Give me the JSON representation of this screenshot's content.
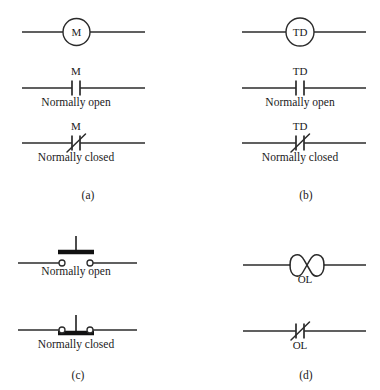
{
  "figure": {
    "background_color": "#ffffff",
    "line_color": "#2b2b2b"
  },
  "panels": [
    {
      "id": "a",
      "caption": "(a)",
      "device": "M",
      "rows": [
        {
          "kind": "coil",
          "label": "M",
          "state_label": ""
        },
        {
          "kind": "contact-no",
          "label": "M",
          "state_label": "Normally open"
        },
        {
          "kind": "contact-nc",
          "label": "M",
          "state_label": "Normally closed"
        }
      ]
    },
    {
      "id": "b",
      "caption": "(b)",
      "device": "TD",
      "rows": [
        {
          "kind": "coil",
          "label": "TD",
          "state_label": ""
        },
        {
          "kind": "contact-no",
          "label": "TD",
          "state_label": "Normally open"
        },
        {
          "kind": "contact-nc",
          "label": "TD",
          "state_label": "Normally closed"
        }
      ]
    },
    {
      "id": "c",
      "caption": "(c)",
      "device": "pushbutton",
      "rows": [
        {
          "kind": "pushbutton-no",
          "label": "",
          "state_label": "Normally open"
        },
        {
          "kind": "pushbutton-nc",
          "label": "",
          "state_label": "Normally closed"
        }
      ]
    },
    {
      "id": "d",
      "caption": "(d)",
      "device": "OL",
      "rows": [
        {
          "kind": "heater",
          "label": "OL",
          "state_label": ""
        },
        {
          "kind": "contact-nc",
          "label": "OL",
          "state_label": ""
        }
      ]
    }
  ],
  "labels": {
    "m_coil": "M",
    "m_no": "M",
    "m_nc": "M",
    "td_coil": "TD",
    "td_no": "TD",
    "td_nc": "TD",
    "ol_heater": "OL",
    "ol_contact": "OL",
    "normally_open": "Normally open",
    "normally_closed": "Normally closed",
    "caption_a": "(a)",
    "caption_b": "(b)",
    "caption_c": "(c)",
    "caption_d": "(d)"
  }
}
